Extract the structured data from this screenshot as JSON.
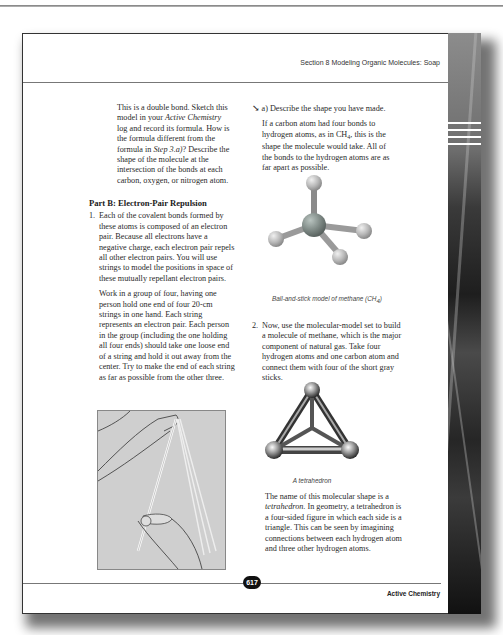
{
  "header": {
    "running_title": "Section 8  Modeling Organic Molecules: Soap"
  },
  "left_column": {
    "intro_paragraph": [
      "This is a double bond. Sketch this model in your ",
      "Active Chemistry",
      " log and record its formula. How is the formula different from the formula in ",
      "Step 3.a)",
      "? Describe the shape of the molecule at the intersection of the bonds at each carbon, oxygen, or nitrogen atom."
    ],
    "part_heading": "Part B: Electron-Pair Repulsion",
    "step1": {
      "number": "1.",
      "paragraph1": "Each of the covalent bonds formed by these atoms is composed of an electron pair. Because all electrons have a negative charge, each electron pair repels all other electron pairs. You will use strings to model the positions in space of these mutually repellant electron pairs.",
      "paragraph2": "Work in a group of four, having one person hold one end of four 20-cm strings in one hand. Each string represents an electron pair. Each person in the group (including the one holding all four ends) should take one loose end of a string and hold it out away from the center. Try to make the end of each string as far as possible from the other three."
    },
    "illustration": "hands-holding-strings"
  },
  "right_column": {
    "question_a": {
      "icon": "pencil-log-icon",
      "label": "a) Describe the shape you have made.",
      "answer": [
        "If a carbon atom had four bonds to hydrogen atoms, as in CH",
        "4",
        ", this is the shape the molecule would take. All of the bonds to the hydrogen atoms are as far apart as possible."
      ]
    },
    "figure1": {
      "caption": [
        "Ball-and-stick model of methane (CH",
        "4",
        ")"
      ]
    },
    "step2": {
      "number": "2.",
      "text": "Now, use the molecular-model set to build a molecule of methane, which is the major component of natural gas. Take four hydrogen atoms and one carbon atom and connect them with four of the short gray sticks."
    },
    "figure2": {
      "caption": "A tetrahedron"
    },
    "closing_paragraph": [
      "The name of this molecular shape is a ",
      "tetrahedron",
      ". In geometry, a tetrahedron is a four-sided figure in which each side is a triangle. This can be seen by imagining connections between each hydrogen atom and three other hydrogen atoms."
    ]
  },
  "footer": {
    "page_number": "617",
    "book_title": "Active Chemistry"
  },
  "colors": {
    "text": "#2a2a2a",
    "rule": "#777777",
    "illustration_bg": "#cfcfcf",
    "atom_gray": "#a8a8a8",
    "carbon_gray": "#7f8a86"
  }
}
